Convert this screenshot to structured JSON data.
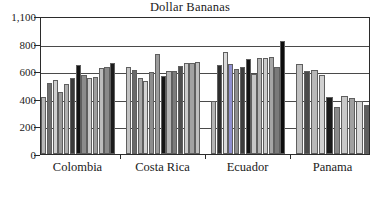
{
  "chart_data": {
    "type": "bar",
    "title": "Dollar Bananas",
    "xlabel": "",
    "ylabel": "",
    "categories": [
      "Colombia",
      "Costa Rica",
      "Ecuador",
      "Panama"
    ],
    "ytick_labels": [
      "1,100",
      "800",
      "600",
      "400",
      "200",
      "0"
    ],
    "ytick_values": [
      1100,
      800,
      600,
      400,
      200,
      0
    ],
    "ylim": [
      0,
      1100
    ],
    "grid": true,
    "legend": "none",
    "note": "Y-axis ticks are drawn at equal pixel spacing although value gaps are unequal (1100-800 = 300, others = 200).",
    "bars_per_group": 10,
    "series_values": {
      "Colombia": [
        412,
        512,
        533,
        447,
        510,
        551,
        648,
        571,
        548,
        556
      ],
      "Costa Rica": [
        601,
        620,
        648,
        632,
        663,
        625,
        607,
        530,
        597,
        724
      ],
      "Ecuador": [
        566,
        603,
        602,
        638,
        662,
        657,
        633,
        686,
        386,
        647
      ],
      "Panama": [
        650,
        614,
        627,
        687,
        577,
        696,
        693,
        701,
        634,
        829
      ]
    },
    "group_bar_values": [
      [
        412,
        512,
        533,
        447,
        510,
        551,
        648,
        571,
        548,
        556,
        620,
        648,
        632,
        663
      ],
      [
        625,
        607,
        530,
        597,
        724,
        566,
        603,
        602,
        638,
        662,
        657,
        633,
        686
      ],
      [
        386,
        647,
        650,
        614,
        627,
        687,
        577,
        696,
        693,
        701,
        634,
        829
      ],
      [
        649,
        598,
        607,
        574,
        414,
        340,
        418,
        408,
        386,
        356
      ]
    ],
    "shade_palette": [
      "#b0b0b0",
      "#8a8a8a",
      "#4a4a4a",
      "#d2d2d2",
      "#6e6e6e",
      "#9e9e9e",
      "#2a2a2a",
      "#c0c0c0",
      "#7a7a7a",
      "#111111"
    ]
  },
  "axis": {
    "ticks": [
      {
        "label": "1,100",
        "value": 1100
      },
      {
        "label": "800",
        "value": 800
      },
      {
        "label": "600",
        "value": 600
      },
      {
        "label": "400",
        "value": 400
      },
      {
        "label": "200",
        "value": 200
      },
      {
        "label": "0",
        "value": 0
      }
    ]
  },
  "groups": [
    {
      "name": "Colombia",
      "bars": [
        {
          "value": 412,
          "shade": "#b8b8b8"
        },
        {
          "value": 512,
          "shade": "#6e6e6e"
        },
        {
          "value": 533,
          "shade": "#cfcfcf"
        },
        {
          "value": 447,
          "shade": "#9a9a9a"
        },
        {
          "value": 510,
          "shade": "#b0b0b0"
        },
        {
          "value": 551,
          "shade": "#3a3a3a"
        },
        {
          "value": 648,
          "shade": "#141414"
        },
        {
          "value": 571,
          "shade": "#8c8c8c"
        },
        {
          "value": 548,
          "shade": "#c8c8c8"
        },
        {
          "value": 556,
          "shade": "#9e9e9e"
        },
        {
          "value": 620,
          "shade": "#bdbdbd"
        },
        {
          "value": 634,
          "shade": "#8a8a8a"
        },
        {
          "value": 663,
          "shade": "#1c1c1c"
        }
      ]
    },
    {
      "name": "Costa Rica",
      "bars": [
        {
          "value": 627,
          "shade": "#c2c2c2"
        },
        {
          "value": 607,
          "shade": "#6a6a6a"
        },
        {
          "value": 552,
          "shade": "#a8a8a8"
        },
        {
          "value": 530,
          "shade": "#d4d4d4"
        },
        {
          "value": 597,
          "shade": "#8e8e8e"
        },
        {
          "value": 724,
          "shade": "#9c9c9c"
        },
        {
          "value": 566,
          "shade": "#161616"
        },
        {
          "value": 602,
          "shade": "#b6b6b6"
        },
        {
          "value": 604,
          "shade": "#7c7c7c"
        },
        {
          "value": 638,
          "shade": "#4e4e4e"
        },
        {
          "value": 662,
          "shade": "#cacaca"
        },
        {
          "value": 657,
          "shade": "#a2a2a2"
        },
        {
          "value": 666,
          "shade": "#bfbfbf"
        }
      ]
    },
    {
      "name": "Ecuador",
      "bars": [
        {
          "value": 386,
          "shade": "#b4b4b4"
        },
        {
          "value": 647,
          "shade": "#2e2e2e"
        },
        {
          "value": 740,
          "shade": "#dadada"
        },
        {
          "value": 650,
          "shade": "#9090d0"
        },
        {
          "value": 614,
          "shade": "#8e8e8e"
        },
        {
          "value": 627,
          "shade": "#3c3c3c"
        },
        {
          "value": 687,
          "shade": "#141414"
        },
        {
          "value": 577,
          "shade": "#c6c6c6"
        },
        {
          "value": 696,
          "shade": "#b2b2b2"
        },
        {
          "value": 693,
          "shade": "#cccccc"
        },
        {
          "value": 701,
          "shade": "#a6a6a6"
        },
        {
          "value": 634,
          "shade": "#7a7a7a"
        },
        {
          "value": 829,
          "shade": "#0d0d0d"
        }
      ]
    },
    {
      "name": "Panama",
      "bars": [
        {
          "value": 649,
          "shade": "#c0c0c0"
        },
        {
          "value": 598,
          "shade": "#4a4a4a"
        },
        {
          "value": 607,
          "shade": "#b8b8b8"
        },
        {
          "value": 574,
          "shade": "#d0d0d0"
        },
        {
          "value": 414,
          "shade": "#1a1a1a"
        },
        {
          "value": 340,
          "shade": "#8a8a8a"
        },
        {
          "value": 418,
          "shade": "#c8c8c8"
        },
        {
          "value": 408,
          "shade": "#a0a0a0"
        },
        {
          "value": 386,
          "shade": "#d6d6d6"
        },
        {
          "value": 356,
          "shade": "#5e5e5e"
        }
      ]
    }
  ]
}
